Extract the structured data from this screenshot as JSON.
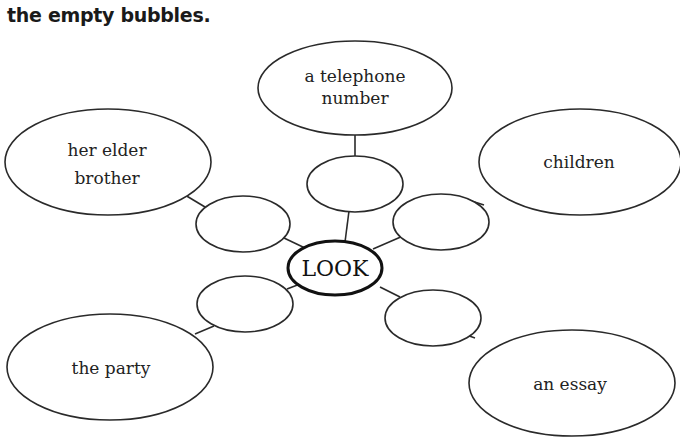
{
  "instruction": {
    "title": "the empty bubbles."
  },
  "diagram": {
    "center": {
      "label": "LOOK"
    },
    "branches": [
      {
        "id": "top",
        "label_lines": [
          "a telephone",
          "number"
        ],
        "empty_bubble": ""
      },
      {
        "id": "upper-left",
        "label_lines": [
          "her elder",
          "brother"
        ],
        "empty_bubble": ""
      },
      {
        "id": "upper-right",
        "label_lines": [
          "children"
        ],
        "empty_bubble": ""
      },
      {
        "id": "lower-left",
        "label_lines": [
          "the party"
        ],
        "empty_bubble": ""
      },
      {
        "id": "lower-right",
        "label_lines": [
          "an essay"
        ],
        "empty_bubble": ""
      }
    ],
    "colors": {
      "stroke": "#2a2a2a",
      "text": "#222222",
      "background": "#ffffff"
    }
  }
}
